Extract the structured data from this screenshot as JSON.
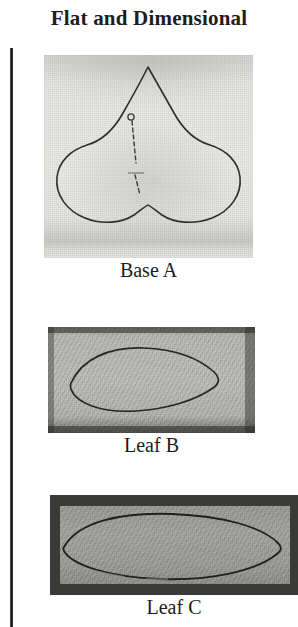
{
  "page": {
    "title": "Flat and Dimensional",
    "background_color": "#ffffff",
    "text_color": "#1d1d1d"
  },
  "rule": {
    "name": "left-vertical-rule",
    "color": "#111111"
  },
  "figures": [
    {
      "id": "base-a",
      "caption": "Base A",
      "subject": "square fabric swatch with traced three-lobed trefoil base shape and dashed centre stitch line",
      "shape": "trefoil",
      "fabric_tone": "#e6e6e3",
      "ink_color": "#2e2e2c"
    },
    {
      "id": "leaf-b",
      "caption": "Leaf B",
      "subject": "narrow rectangular fabric swatch with traced pointed leaf outline",
      "shape": "leaf",
      "fabric_tone": "#bdbdb9",
      "ink_color": "#262624"
    },
    {
      "id": "leaf-c",
      "caption": "Leaf C",
      "subject": "wide rectangular fabric swatch with dark border and traced large pointed leaf outline",
      "shape": "leaf",
      "fabric_tone": "#9f9f9b",
      "border_tone": "#3a3a38",
      "ink_color": "#1f1f1e"
    }
  ]
}
